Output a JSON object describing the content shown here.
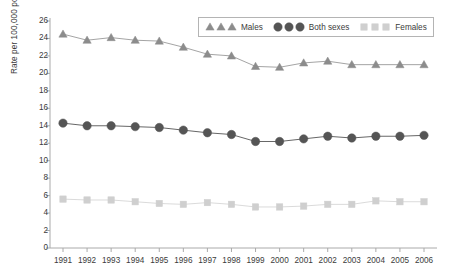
{
  "chart_data": {
    "type": "line",
    "title": "",
    "subtitle": "",
    "xlabel": "",
    "ylabel": "Rate per 100,000 population",
    "categories": [
      "1991",
      "1992",
      "1993",
      "1994",
      "1995",
      "1996",
      "1997",
      "1998",
      "1999",
      "2000",
      "2001",
      "2002",
      "2003",
      "2004",
      "2005",
      "2006"
    ],
    "x": [
      1991,
      1992,
      1993,
      1994,
      1995,
      1996,
      1997,
      1998,
      1999,
      2000,
      2001,
      2002,
      2003,
      2004,
      2005,
      2006
    ],
    "ylim": [
      0,
      26
    ],
    "ytick_values": [
      0,
      2,
      4,
      6,
      8,
      10,
      12,
      14,
      16,
      18,
      20,
      22,
      24,
      26
    ],
    "ytick_labels": [
      "0",
      "2",
      "4",
      "6",
      "8",
      "10",
      "12",
      "14",
      "16",
      "18",
      "20",
      "22",
      "24",
      "26"
    ],
    "grid": false,
    "legend_position": "top-right",
    "series": [
      {
        "name": "Males",
        "marker": "triangle",
        "color": "#8c8c8c",
        "line_color": "#9a9a9a",
        "values": [
          24.5,
          23.8,
          24.1,
          23.8,
          23.7,
          23.0,
          22.2,
          22.0,
          20.8,
          20.7,
          21.2,
          21.4,
          21.0,
          21.0,
          21.0,
          21.0
        ]
      },
      {
        "name": "Both sexes",
        "marker": "circle",
        "color": "#555555",
        "line_color": "#555555",
        "values": [
          14.3,
          14.0,
          14.0,
          13.9,
          13.8,
          13.5,
          13.2,
          13.0,
          12.2,
          12.2,
          12.5,
          12.8,
          12.6,
          12.8,
          12.8,
          12.9
        ]
      },
      {
        "name": "Females",
        "marker": "square",
        "color": "#cfcfcf",
        "line_color": "#d6d6d6",
        "values": [
          5.6,
          5.5,
          5.5,
          5.3,
          5.1,
          5.0,
          5.2,
          5.0,
          4.7,
          4.7,
          4.8,
          5.0,
          5.0,
          5.4,
          5.3,
          5.3
        ]
      }
    ]
  },
  "axis": {
    "axis_color": "#aaaaaa",
    "tick_color": "#aaaaaa",
    "text_color": "#3b3b3b"
  },
  "legend": {
    "border_color": "#b4b4b4",
    "entries": [
      {
        "label": "Males",
        "marker": "triangle",
        "color": "#8c8c8c"
      },
      {
        "label": "Both sexes",
        "marker": "circle",
        "color": "#555555"
      },
      {
        "label": "Females",
        "marker": "square",
        "color": "#cfcfcf"
      }
    ]
  }
}
